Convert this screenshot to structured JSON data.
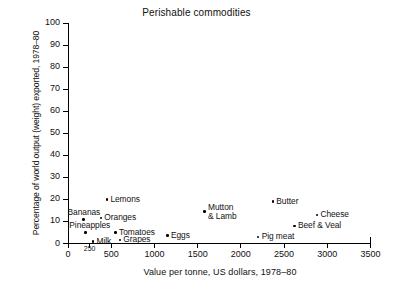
{
  "chart_data": {
    "type": "scatter",
    "title": "Perishable commodities",
    "xlabel": "Value per tonne, US dollars, 1978–80",
    "ylabel": "Percentage of world output (weight) exported, 1978–80",
    "xlim": [
      0,
      3500
    ],
    "ylim": [
      0,
      100
    ],
    "grid": false,
    "legend": "none",
    "xticks": [
      {
        "value": 0,
        "label": "0",
        "minor": false
      },
      {
        "value": 250,
        "label": "250",
        "minor": true
      },
      {
        "value": 500,
        "label": "500",
        "minor": false
      },
      {
        "value": 1000,
        "label": "1000",
        "minor": false
      },
      {
        "value": 1500,
        "label": "1500",
        "minor": false
      },
      {
        "value": 2000,
        "label": "2000",
        "minor": false
      },
      {
        "value": 2500,
        "label": "2500",
        "minor": false
      },
      {
        "value": 3000,
        "label": "3000",
        "minor": false
      },
      {
        "value": 3500,
        "label": "3500",
        "minor": false
      }
    ],
    "yticks": [
      {
        "value": 0,
        "label": "0"
      },
      {
        "value": 10,
        "label": "10"
      },
      {
        "value": 20,
        "label": "20"
      },
      {
        "value": 30,
        "label": "30"
      },
      {
        "value": 40,
        "label": "40"
      },
      {
        "value": 50,
        "label": "50"
      },
      {
        "value": 60,
        "label": "60"
      },
      {
        "value": 70,
        "label": "70"
      },
      {
        "value": 80,
        "label": "80"
      },
      {
        "value": 90,
        "label": "90"
      },
      {
        "value": 100,
        "label": "100"
      }
    ],
    "points": [
      {
        "name": "Bananas",
        "x": 180,
        "y": 11.0,
        "label": "Bananas",
        "label_pos": "above-left"
      },
      {
        "name": "Pineapples",
        "x": 200,
        "y": 5.0,
        "label": "Pineapples",
        "label_pos": "above-left"
      },
      {
        "name": "Milk",
        "x": 290,
        "y": 1.0,
        "label": "Milk",
        "label_pos": "right"
      },
      {
        "name": "Oranges",
        "x": 380,
        "y": 11.5,
        "label": "Oranges",
        "label_pos": "right"
      },
      {
        "name": "Lemons",
        "x": 450,
        "y": 20.0,
        "label": "Lemons",
        "label_pos": "right"
      },
      {
        "name": "Tomatoes",
        "x": 550,
        "y": 5.0,
        "label": "Tomatoes",
        "label_pos": "right"
      },
      {
        "name": "Grapes",
        "x": 600,
        "y": 1.5,
        "label": "Grapes",
        "label_pos": "right"
      },
      {
        "name": "Eggs",
        "x": 1150,
        "y": 3.5,
        "label": "Eggs",
        "label_pos": "right"
      },
      {
        "name": "Mutton & Lamb",
        "x": 1580,
        "y": 14.5,
        "label": "Mutton\n& Lamb",
        "label_pos": "right"
      },
      {
        "name": "Pig meat",
        "x": 2200,
        "y": 3.0,
        "label": "Pig meat",
        "label_pos": "right"
      },
      {
        "name": "Butter",
        "x": 2370,
        "y": 19.0,
        "label": "Butter",
        "label_pos": "right"
      },
      {
        "name": "Beef & Veal",
        "x": 2620,
        "y": 8.0,
        "label": "Beef & Veal",
        "label_pos": "right"
      },
      {
        "name": "Cheese",
        "x": 2880,
        "y": 13.0,
        "label": "Cheese",
        "label_pos": "right"
      }
    ]
  }
}
